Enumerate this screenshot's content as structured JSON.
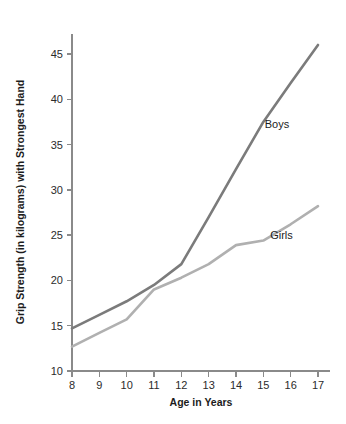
{
  "chart_data": {
    "type": "line",
    "title": "",
    "xlabel": "Age in Years",
    "ylabel": "Grip Strength (in kilograms) with Strongest Hand",
    "x": [
      8,
      9,
      10,
      11,
      12,
      13,
      14,
      15,
      16,
      17
    ],
    "categories": [
      "8",
      "9",
      "10",
      "11",
      "12",
      "13",
      "14",
      "15",
      "16",
      "17"
    ],
    "xtick_labels": [
      "8",
      "9",
      "10",
      "11",
      "12",
      "13",
      "14",
      "15",
      "16",
      "17"
    ],
    "ytick_labels": [
      "10",
      "15",
      "20",
      "25",
      "30",
      "35",
      "40",
      "45"
    ],
    "ytick_values": [
      10,
      15,
      20,
      25,
      30,
      35,
      40,
      45
    ],
    "xlim": [
      8,
      17
    ],
    "ylim": [
      10,
      46.5
    ],
    "grid": false,
    "legend_position": "inline-annotation",
    "series": [
      {
        "name": "Boys",
        "label": "Boys",
        "color": "#7b7b7b",
        "values": [
          14.7,
          16.2,
          17.7,
          19.5,
          21.8,
          27.0,
          32.3,
          37.5,
          41.8,
          46.0
        ]
      },
      {
        "name": "Girls",
        "label": "Girls",
        "color": "#b0b0b0",
        "values": [
          12.7,
          14.2,
          15.7,
          19.0,
          20.3,
          21.8,
          23.9,
          24.4,
          26.2,
          28.2
        ]
      }
    ],
    "annotations": [
      {
        "text": "Boys",
        "x": 15.05,
        "y": 36.8
      },
      {
        "text": "Girls",
        "x": 15.25,
        "y": 24.6
      }
    ]
  },
  "axes": {
    "x_title": "Age in Years",
    "y_title": "Grip Strength (in kilograms) with Strongest Hand",
    "axis_color": "#8a8a8a"
  }
}
